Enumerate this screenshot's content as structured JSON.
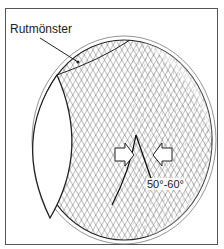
{
  "diagram": {
    "labels": {
      "pattern": "Rutmönster",
      "angle": "50°-60°"
    },
    "colors": {
      "line": "#222222",
      "background": "#ffffff",
      "frame": "#555555"
    }
  }
}
